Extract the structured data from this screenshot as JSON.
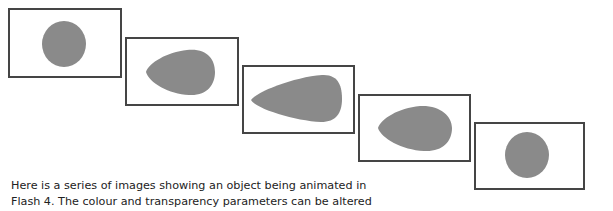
{
  "figure": {
    "shape_color": "#8a8a8a",
    "frame_border_color": "#454545",
    "frames": [
      {
        "index": 1,
        "shape": "circle"
      },
      {
        "index": 2,
        "shape": "teardrop"
      },
      {
        "index": 3,
        "shape": "elongated-teardrop"
      },
      {
        "index": 4,
        "shape": "teardrop"
      },
      {
        "index": 5,
        "shape": "circle"
      }
    ]
  },
  "caption": {
    "line1": "Here is a series of images showing an object being animated in",
    "line2": "Flash 4. The colour and transparency parameters can be altered"
  }
}
